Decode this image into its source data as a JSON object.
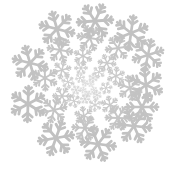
{
  "canvas": {
    "width": 174,
    "height": 177,
    "background_color": "#ffffff",
    "title": "Snowflake Spiral Burst"
  },
  "artwork": {
    "name": "snowflake-spiral-burst",
    "motif": "snowflake",
    "motif_points": 6,
    "arrangement": "logarithmic-spiral-radial-burst",
    "arm_count": 6,
    "ring_count": 7,
    "center_x": 87,
    "center_y": 88,
    "flake_color": "#c8c8c8",
    "flake_color_outer": "#bdbdbd",
    "flake_color_inner": "#d6d6d6",
    "stroke_width_ratio": 0.155,
    "spiral_twist_deg_per_ring": 13,
    "min_radius": 5,
    "max_radius": 76,
    "min_size": 3,
    "max_size": 25,
    "total_flakes": 42,
    "flakes": [
      {
        "x": 91,
        "y": 84,
        "size": 3.2,
        "rot": 5,
        "color": "#dcdcdc"
      },
      {
        "x": 85,
        "y": 83,
        "size": 3.4,
        "rot": 22,
        "color": "#dadada"
      },
      {
        "x": 83,
        "y": 90,
        "size": 3.3,
        "rot": 40,
        "color": "#dbdbdb"
      },
      {
        "x": 88,
        "y": 94,
        "size": 3.5,
        "rot": 58,
        "color": "#d9d9d9"
      },
      {
        "x": 94,
        "y": 90,
        "size": 3.4,
        "rot": 12,
        "color": "#dadada"
      },
      {
        "x": 93,
        "y": 78,
        "size": 4.6,
        "rot": 30,
        "color": "#d6d6d6"
      },
      {
        "x": 80,
        "y": 78,
        "size": 4.8,
        "rot": 48,
        "color": "#d5d5d5"
      },
      {
        "x": 76,
        "y": 90,
        "size": 4.7,
        "rot": 66,
        "color": "#d6d6d6"
      },
      {
        "x": 85,
        "y": 99,
        "size": 4.9,
        "rot": 4,
        "color": "#d4d4d4"
      },
      {
        "x": 97,
        "y": 95,
        "size": 4.6,
        "rot": 24,
        "color": "#d6d6d6"
      },
      {
        "x": 99,
        "y": 72,
        "size": 6.4,
        "rot": 41,
        "color": "#d0d0d0"
      },
      {
        "x": 81,
        "y": 68,
        "size": 6.6,
        "rot": 59,
        "color": "#cfcfcf"
      },
      {
        "x": 68,
        "y": 82,
        "size": 6.5,
        "rot": 77,
        "color": "#d0d0d0"
      },
      {
        "x": 74,
        "y": 101,
        "size": 6.7,
        "rot": 15,
        "color": "#cecece"
      },
      {
        "x": 95,
        "y": 105,
        "size": 6.5,
        "rot": 33,
        "color": "#d0d0d0"
      },
      {
        "x": 106,
        "y": 88,
        "size": 6.3,
        "rot": 51,
        "color": "#d1d1d1"
      },
      {
        "x": 107,
        "y": 63,
        "size": 9.0,
        "rot": 8,
        "color": "#cacaca"
      },
      {
        "x": 83,
        "y": 56,
        "size": 9.4,
        "rot": 26,
        "color": "#c9c9c9"
      },
      {
        "x": 62,
        "y": 70,
        "size": 9.2,
        "rot": 44,
        "color": "#cacaca"
      },
      {
        "x": 62,
        "y": 96,
        "size": 9.3,
        "rot": 62,
        "color": "#c9c9c9"
      },
      {
        "x": 84,
        "y": 116,
        "size": 9.5,
        "rot": 80,
        "color": "#c8c8c8"
      },
      {
        "x": 110,
        "y": 105,
        "size": 9.1,
        "rot": 18,
        "color": "#cacaca"
      },
      {
        "x": 116,
        "y": 76,
        "size": 9.0,
        "rot": 36,
        "color": "#cbcbcb"
      },
      {
        "x": 118,
        "y": 48,
        "size": 12.5,
        "rot": 52,
        "color": "#c6c6c6"
      },
      {
        "x": 90,
        "y": 38,
        "size": 13.0,
        "rot": 70,
        "color": "#c5c5c5"
      },
      {
        "x": 60,
        "y": 50,
        "size": 12.8,
        "rot": 10,
        "color": "#c6c6c6"
      },
      {
        "x": 45,
        "y": 78,
        "size": 12.7,
        "rot": 28,
        "color": "#c6c6c6"
      },
      {
        "x": 54,
        "y": 110,
        "size": 13.0,
        "rot": 46,
        "color": "#c5c5c5"
      },
      {
        "x": 85,
        "y": 128,
        "size": 12.9,
        "rot": 64,
        "color": "#c5c5c5"
      },
      {
        "x": 118,
        "y": 118,
        "size": 12.6,
        "rot": 2,
        "color": "#c6c6c6"
      },
      {
        "x": 130,
        "y": 88,
        "size": 12.4,
        "rot": 20,
        "color": "#c7c7c7"
      },
      {
        "x": 131,
        "y": 33,
        "size": 17.5,
        "rot": 38,
        "color": "#c2c2c2"
      },
      {
        "x": 95,
        "y": 21,
        "size": 18.0,
        "rot": 56,
        "color": "#c1c1c1"
      },
      {
        "x": 57,
        "y": 29,
        "size": 17.8,
        "rot": 74,
        "color": "#c2c2c2"
      },
      {
        "x": 30,
        "y": 63,
        "size": 17.6,
        "rot": 14,
        "color": "#c2c2c2"
      },
      {
        "x": 28,
        "y": 104,
        "size": 17.9,
        "rot": 32,
        "color": "#c1c1c1"
      },
      {
        "x": 56,
        "y": 138,
        "size": 18.0,
        "rot": 50,
        "color": "#c1c1c1"
      },
      {
        "x": 98,
        "y": 144,
        "size": 17.8,
        "rot": 68,
        "color": "#c1c1c1"
      },
      {
        "x": 134,
        "y": 126,
        "size": 17.4,
        "rot": 6,
        "color": "#c2c2c2"
      },
      {
        "x": 146,
        "y": 85,
        "size": 17.2,
        "rot": 24,
        "color": "#c3c3c3"
      },
      {
        "x": 148,
        "y": 55,
        "size": 16.0,
        "rot": 42,
        "color": "#c3c3c3"
      },
      {
        "x": 142,
        "y": 107,
        "size": 16.2,
        "rot": 60,
        "color": "#c3c3c3"
      }
    ]
  }
}
